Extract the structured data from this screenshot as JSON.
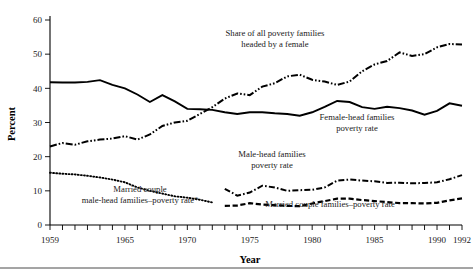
{
  "chart_data": {
    "type": "line",
    "title": "",
    "xlabel": "Year",
    "ylabel": "Percent",
    "xlim": [
      1959,
      1992
    ],
    "ylim": [
      0,
      60
    ],
    "ytick_values": [
      0,
      10,
      20,
      30,
      40,
      50,
      60
    ],
    "ytick_labels": [
      "0",
      "10",
      "20",
      "30",
      "40",
      "50",
      "60"
    ],
    "xtick_values": [
      1959,
      1960,
      1961,
      1962,
      1963,
      1964,
      1965,
      1966,
      1967,
      1968,
      1969,
      1970,
      1971,
      1972,
      1973,
      1974,
      1975,
      1976,
      1977,
      1978,
      1979,
      1980,
      1981,
      1982,
      1983,
      1984,
      1985,
      1986,
      1987,
      1988,
      1989,
      1990,
      1991,
      1992
    ],
    "xtick_labels_shown": [
      {
        "value": 1959,
        "label": "1959"
      },
      {
        "value": 1965,
        "label": "1965"
      },
      {
        "value": 1970,
        "label": "1970"
      },
      {
        "value": 1975,
        "label": "1975"
      },
      {
        "value": 1980,
        "label": "1980"
      },
      {
        "value": 1985,
        "label": "1985"
      },
      {
        "value": 1990,
        "label": "1990"
      },
      {
        "value": 1992,
        "label": "1992"
      }
    ],
    "grid": false,
    "legend_position": "inline-annotations",
    "series": [
      {
        "name": "Female-head families poverty rate",
        "style": "solid",
        "x": [
          1959,
          1960,
          1961,
          1962,
          1963,
          1964,
          1965,
          1966,
          1967,
          1968,
          1969,
          1970,
          1971,
          1972,
          1973,
          1974,
          1975,
          1976,
          1977,
          1978,
          1979,
          1980,
          1981,
          1982,
          1983,
          1984,
          1985,
          1986,
          1987,
          1988,
          1989,
          1990,
          1991,
          1992
        ],
        "values": [
          41.8,
          41.7,
          41.7,
          41.9,
          42.4,
          41.0,
          40.0,
          38.2,
          36.0,
          38.0,
          36.2,
          34.0,
          33.9,
          33.7,
          33.0,
          32.5,
          33.0,
          33.0,
          32.7,
          32.5,
          32.0,
          33.0,
          34.6,
          36.3,
          36.0,
          34.5,
          34.0,
          34.6,
          34.2,
          33.5,
          32.3,
          33.4,
          35.6,
          34.9
        ]
      },
      {
        "name": "Share of all poverty families headed by a female",
        "style": "dash-dot-dot",
        "x": [
          1959,
          1960,
          1961,
          1962,
          1963,
          1964,
          1965,
          1966,
          1967,
          1968,
          1969,
          1970,
          1971,
          1972,
          1973,
          1974,
          1975,
          1976,
          1977,
          1978,
          1979,
          1980,
          1981,
          1982,
          1983,
          1984,
          1985,
          1986,
          1987,
          1988,
          1989,
          1990,
          1991,
          1992
        ],
        "values": [
          23.0,
          24.0,
          23.5,
          24.5,
          25.0,
          25.3,
          26.0,
          25.0,
          26.5,
          29.0,
          30.0,
          30.5,
          32.5,
          34.5,
          37.0,
          38.5,
          38.0,
          40.5,
          41.5,
          43.5,
          44.0,
          42.5,
          42.0,
          41.0,
          42.0,
          45.0,
          47.0,
          48.0,
          50.5,
          49.5,
          50.0,
          52.0,
          53.0,
          52.8
        ]
      },
      {
        "name": "Married couple male-head families–poverty rate*",
        "style": "dotted",
        "x": [
          1959,
          1960,
          1961,
          1962,
          1963,
          1964,
          1965,
          1966,
          1967,
          1968,
          1969,
          1970,
          1971,
          1972
        ],
        "values": [
          15.3,
          15.0,
          14.8,
          14.4,
          13.9,
          13.3,
          12.5,
          11.0,
          10.0,
          9.2,
          8.4,
          8.0,
          7.4,
          6.6
        ]
      },
      {
        "name": "Male-head families poverty rate",
        "style": "dash-dot",
        "x": [
          1973,
          1974,
          1975,
          1976,
          1977,
          1978,
          1979,
          1980,
          1981,
          1982,
          1983,
          1984,
          1985,
          1986,
          1987,
          1988,
          1989,
          1990,
          1991,
          1992
        ],
        "values": [
          10.6,
          8.6,
          9.5,
          11.5,
          11.0,
          10.0,
          10.2,
          10.3,
          11.0,
          13.0,
          13.3,
          13.0,
          12.8,
          12.3,
          12.4,
          12.2,
          12.3,
          12.5,
          13.4,
          14.6
        ]
      },
      {
        "name": "Married couple families–poverty rate",
        "style": "dashed",
        "x": [
          1973,
          1974,
          1975,
          1976,
          1977,
          1978,
          1979,
          1980,
          1981,
          1982,
          1983,
          1984,
          1985,
          1986,
          1987,
          1988,
          1989,
          1990,
          1991,
          1992
        ],
        "values": [
          5.6,
          5.7,
          6.4,
          6.0,
          5.8,
          5.6,
          5.5,
          6.3,
          7.0,
          7.7,
          7.7,
          7.3,
          7.0,
          6.7,
          6.4,
          6.4,
          6.3,
          6.5,
          7.2,
          7.8
        ]
      }
    ],
    "annotations": [
      {
        "id": "annot-share-female",
        "lines": [
          "Share of all poverty families",
          "headed by a female"
        ],
        "x": 275,
        "y": 36
      },
      {
        "id": "annot-female-head",
        "lines": [
          "Female-head families",
          "poverty rate"
        ],
        "x": 357,
        "y": 120
      },
      {
        "id": "annot-male-head",
        "lines": [
          "Male-head families",
          "poverty rate"
        ],
        "x": 272,
        "y": 157
      },
      {
        "id": "annot-married-couple-rate",
        "lines": [
          "Married couple families–poverty rate"
        ],
        "x": 330,
        "y": 207
      },
      {
        "id": "annot-married-male-head",
        "lines": [
          "Married couple",
          "male-head families–poverty rate*"
        ],
        "x": 140,
        "y": 192
      }
    ],
    "colors": {
      "line": "#000000",
      "text": "#1a1a1a",
      "background": "#ffffff"
    }
  }
}
